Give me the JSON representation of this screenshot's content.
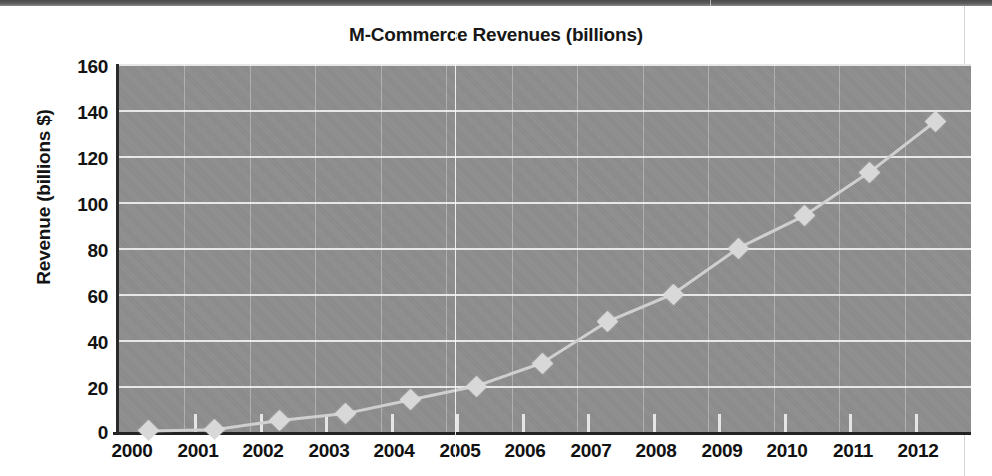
{
  "chart_data": {
    "type": "line",
    "title": "M-Commerce Revenues (billions)",
    "xlabel": "",
    "ylabel": "Revenue (billions $)",
    "categories": [
      "2000",
      "2001",
      "2002",
      "2003",
      "2004",
      "2005",
      "2006",
      "2007",
      "2008",
      "2009",
      "2010",
      "2011",
      "2012"
    ],
    "values": [
      0.5,
      1,
      5,
      8,
      14,
      20,
      30,
      48,
      60,
      80,
      94,
      113,
      135
    ],
    "series": [
      {
        "name": "M-Commerce Revenues",
        "values": [
          0.5,
          1,
          5,
          8,
          14,
          20,
          30,
          48,
          60,
          80,
          94,
          113,
          135
        ]
      }
    ],
    "ylim": [
      0,
      160
    ],
    "y_ticks": [
      "0",
      "20",
      "40",
      "60",
      "80",
      "100",
      "120",
      "140",
      "160"
    ],
    "grid": true,
    "legend": "none",
    "marker": "diamond",
    "colors": {
      "plot_background": "#8e8e8e",
      "gridline": "#efefef",
      "axis": "#232323",
      "series_line": "#d0d0d0",
      "marker_fill": "#d8d8d8",
      "page_background": "#ffffff",
      "title_text": "#171717"
    }
  }
}
